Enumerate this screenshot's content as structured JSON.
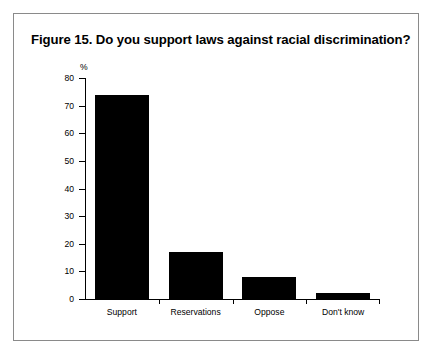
{
  "figure": {
    "title": "Figure 15. Do you support laws against racial discrimination?"
  },
  "chart_data": {
    "type": "bar",
    "title": "Figure 15. Do you support laws against racial discrimination?",
    "categories": [
      "Support",
      "Reservations",
      "Oppose",
      "Don't know"
    ],
    "values": [
      74,
      17,
      8,
      2
    ],
    "xlabel": "",
    "ylabel": "%",
    "ylim": [
      0,
      80
    ],
    "yticks": [
      0,
      10,
      20,
      30,
      40,
      50,
      60,
      70,
      80
    ],
    "ytick_labels": [
      "0",
      "10",
      "20",
      "30",
      "40",
      "50",
      "60",
      "70",
      "80"
    ],
    "grid": false,
    "legend": false,
    "bar_color": "#000000",
    "axis_color": "#000000",
    "background_color": "#ffffff",
    "border_color": "#8a8a8a"
  }
}
